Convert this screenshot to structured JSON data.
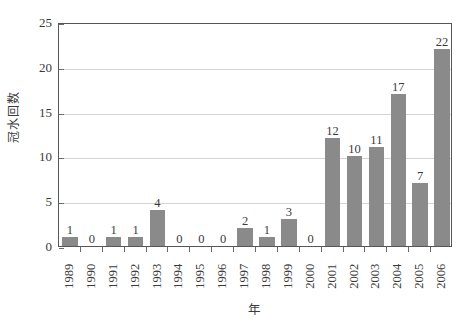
{
  "chart_data": {
    "type": "bar",
    "title": "",
    "xlabel": "年",
    "ylabel": "冠水回数",
    "categories": [
      "1989",
      "1990",
      "1991",
      "1992",
      "1993",
      "1994",
      "1995",
      "1996",
      "1997",
      "1998",
      "1999",
      "2000",
      "2001",
      "2002",
      "2003",
      "2004",
      "2005",
      "2006"
    ],
    "values": [
      1,
      0,
      1,
      1,
      4,
      0,
      0,
      0,
      2,
      1,
      3,
      0,
      12,
      10,
      11,
      17,
      7,
      22
    ],
    "value_labels": [
      "1",
      "0",
      "1",
      "1",
      "4",
      "0",
      "0",
      "0",
      "2",
      "1",
      "3",
      "0",
      "12",
      "10",
      "11",
      "17",
      "7",
      "22"
    ],
    "ylim": [
      0,
      25
    ],
    "yticks": [
      0,
      5,
      10,
      15,
      20,
      25
    ],
    "ytick_labels": [
      "0",
      "5",
      "10",
      "15",
      "20",
      "25"
    ],
    "grid": "horizontal",
    "legend": "none",
    "series_name": "冠水回数",
    "bar_color": "#8a8a8a",
    "grid_color": "#d5d5d5",
    "axis_color": "#565656",
    "background_color": "#ffffff",
    "text_color": "#3a3a3a"
  }
}
